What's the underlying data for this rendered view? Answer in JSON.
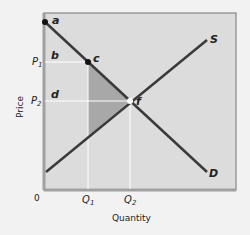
{
  "diagram": {
    "type": "supply-demand-deadweight-loss",
    "axis": {
      "y_label": "Price",
      "x_label": "Quantity",
      "origin_label": "0"
    },
    "y_ticks": [
      {
        "label": "P",
        "sub": "1",
        "y": 62
      },
      {
        "label": "P",
        "sub": "2",
        "y": 101
      }
    ],
    "x_ticks": [
      {
        "label": "Q",
        "sub": "1",
        "x": 88
      },
      {
        "label": "Q",
        "sub": "2",
        "x": 130
      }
    ],
    "curves": {
      "supply_label": "S",
      "demand_label": "D"
    },
    "points": {
      "a": "a",
      "b": "b",
      "c": "c",
      "d": "d",
      "f": "f"
    },
    "colors": {
      "background": "#f2f2f2",
      "plot_fill": "#dcdcdc",
      "frame": "#9a9a9a",
      "curve": "#3a3a3a",
      "shaded_area": "#a8a8a8",
      "guide_lines": "#ffffff"
    }
  }
}
